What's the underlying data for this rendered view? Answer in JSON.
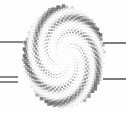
{
  "figure": {
    "name": "dotted-spiral-vortex",
    "title": "",
    "background_color": "#fefefe",
    "width": 126,
    "height": 114
  },
  "chart_data": {
    "type": "scatter",
    "title": "",
    "subtitle": "",
    "xlabel": "",
    "ylabel": "",
    "grid": false,
    "legend_position": "none",
    "xlim": [
      0,
      126
    ],
    "ylim": [
      0,
      114
    ],
    "center": {
      "x": 64,
      "y": 57
    },
    "point_count": 900,
    "golden_angle_deg": 137.507764,
    "radius_scale": 1.72,
    "max_radius": 51,
    "dot_shape": "square",
    "dot_min_size": 0.5,
    "dot_max_size": 3.6,
    "color_min": "#e8e8e8",
    "color_max": "#6f6f6f",
    "aspect_x": 0.8,
    "aspect_y": 1.0,
    "arm_modulation": {
      "arms": 5,
      "phase_deg": 0,
      "alpha_low": 0.1,
      "alpha_high": 1.0
    }
  },
  "rule_lines": [
    {
      "name": "rule-left-upper",
      "x": 0,
      "y": 41,
      "width": 23,
      "height": 2,
      "color": "#8a8a8a"
    },
    {
      "name": "rule-left-lower-1",
      "x": 0,
      "y": 76,
      "width": 18,
      "height": 2,
      "color": "#8a8a8a"
    },
    {
      "name": "rule-left-lower-2",
      "x": 0,
      "y": 81,
      "width": 18,
      "height": 2,
      "color": "#8a8a8a"
    },
    {
      "name": "rule-right-upper",
      "x": 103,
      "y": 42,
      "width": 23,
      "height": 2,
      "color": "#7d7d7d"
    },
    {
      "name": "rule-right-lower",
      "x": 103,
      "y": 78,
      "width": 23,
      "height": 2,
      "color": "#7d7d7d"
    }
  ]
}
